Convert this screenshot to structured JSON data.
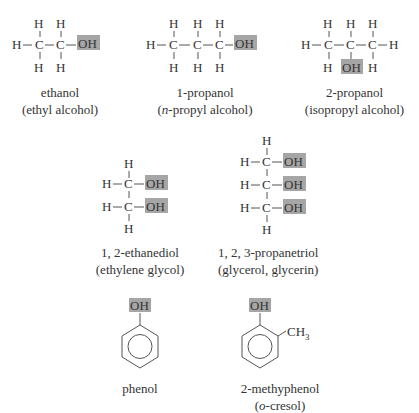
{
  "diagram": {
    "highlight_color": "#a6a6a6",
    "molecules": [
      {
        "id": "ethanol",
        "name": "ethanol",
        "common": "(ethyl alcohol)"
      },
      {
        "id": "1-propanol",
        "name": "1-propanol",
        "common_prefix": "(",
        "common_italic": "n",
        "common_rest": "-propyl alcohol)"
      },
      {
        "id": "2-propanol",
        "name": "2-propanol",
        "common": "(isopropyl alcohol)"
      },
      {
        "id": "ethylene-glycol",
        "name": "1, 2-ethanediol",
        "common": "(ethylene glycol)"
      },
      {
        "id": "glycerol",
        "name": "1, 2, 3-propanetriol",
        "common": "(glycerol, glycerin)"
      },
      {
        "id": "phenol",
        "name": "phenol"
      },
      {
        "id": "o-cresol",
        "name": "2-methyphenol",
        "common_prefix": "(",
        "common_italic": "o",
        "common_rest": "-cresol)"
      }
    ],
    "labels": {
      "H": "H",
      "C": "C",
      "OH": "OH",
      "CH3": "CH",
      "sub3": "3"
    }
  }
}
